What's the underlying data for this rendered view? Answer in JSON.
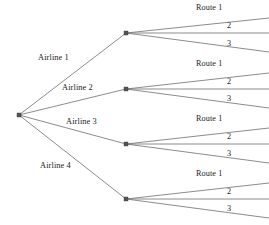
{
  "diagram": {
    "type": "tree-diagram",
    "width": 269,
    "height": 225,
    "colors": {
      "background": "#ffffff",
      "line": "#6e6e6e",
      "node": "#555555",
      "text": "#1c1c1c"
    },
    "root": {
      "x": 19,
      "y": 115
    },
    "branches": [
      {
        "label": "Airline 1",
        "label_x": 38,
        "label_y": 54,
        "node_x": 126,
        "node_y": 33,
        "routes": [
          {
            "label": "Route 1",
            "label_x": 196,
            "label_y": 4,
            "end_x": 269,
            "end_y": 18
          },
          {
            "label": "2",
            "label_x": 227,
            "label_y": 22,
            "end_x": 269,
            "end_y": 33
          },
          {
            "label": "3",
            "label_x": 227,
            "label_y": 40,
            "end_x": 269,
            "end_y": 52
          }
        ]
      },
      {
        "label": "Airline 2",
        "label_x": 62,
        "label_y": 84,
        "node_x": 126,
        "node_y": 89,
        "routes": [
          {
            "label": "Route 1",
            "label_x": 196,
            "label_y": 60,
            "end_x": 269,
            "end_y": 73
          },
          {
            "label": "2",
            "label_x": 227,
            "label_y": 78,
            "end_x": 269,
            "end_y": 89
          },
          {
            "label": "3",
            "label_x": 227,
            "label_y": 95,
            "end_x": 269,
            "end_y": 108
          }
        ]
      },
      {
        "label": "Airline 3",
        "label_x": 66,
        "label_y": 118,
        "node_x": 126,
        "node_y": 144,
        "routes": [
          {
            "label": "Route 1",
            "label_x": 196,
            "label_y": 115,
            "end_x": 269,
            "end_y": 128
          },
          {
            "label": "2",
            "label_x": 227,
            "label_y": 133,
            "end_x": 269,
            "end_y": 144
          },
          {
            "label": "3",
            "label_x": 227,
            "label_y": 150,
            "end_x": 269,
            "end_y": 163
          }
        ]
      },
      {
        "label": "Airline 4",
        "label_x": 40,
        "label_y": 162,
        "node_x": 126,
        "node_y": 199,
        "routes": [
          {
            "label": "Route 1",
            "label_x": 196,
            "label_y": 170,
            "end_x": 269,
            "end_y": 183
          },
          {
            "label": "2",
            "label_x": 227,
            "label_y": 188,
            "end_x": 269,
            "end_y": 199
          },
          {
            "label": "3",
            "label_x": 227,
            "label_y": 205,
            "end_x": 269,
            "end_y": 218
          }
        ]
      }
    ]
  }
}
